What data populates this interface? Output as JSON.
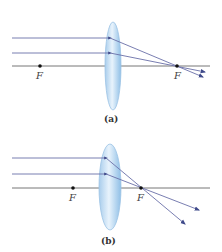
{
  "colors": {
    "axis": "#777777",
    "ray": "#6a6fa8",
    "arrow": "#3f4a8a",
    "lens_edge": "#9cc3e4",
    "lens_fill_light": "#e8f3fc",
    "lens_fill_dark": "#a9cdec",
    "focal_dot": "#111111"
  },
  "panels": [
    {
      "id": "a",
      "caption": "(a)",
      "focal_left_label": "F",
      "focal_right_label": "F",
      "description": "Parallel rays along the axis converge to the focal point F behind the lens"
    },
    {
      "id": "b",
      "caption": "(b)",
      "focal_left_label": "F",
      "focal_right_label": "F",
      "description": "Parallel rays converge at a closer focal point F and diverge beyond it"
    }
  ]
}
